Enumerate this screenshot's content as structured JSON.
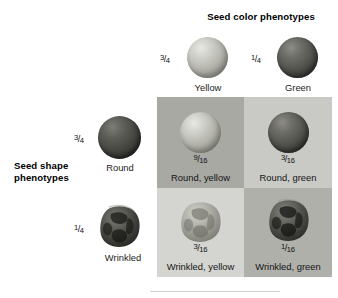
{
  "figure": {
    "type": "dihybrid-cross-phenotype-grid",
    "column_header": "Seed color phenotypes",
    "row_header_line1": "Seed shape",
    "row_header_line2": "phenotypes"
  },
  "column_traits": [
    {
      "label": "Yellow",
      "fraction_num": "3",
      "fraction_slash": "/",
      "fraction_den": "4",
      "seed_style": "round-yellow"
    },
    {
      "label": "Green",
      "fraction_num": "1",
      "fraction_slash": "/",
      "fraction_den": "4",
      "seed_style": "round-green"
    }
  ],
  "row_traits": [
    {
      "label": "Round",
      "fraction_num": "3",
      "fraction_slash": "/",
      "fraction_den": "4",
      "seed_style": "round-green"
    },
    {
      "label": "Wrinkled",
      "fraction_num": "1",
      "fraction_slash": "/",
      "fraction_den": "4",
      "seed_style": "wrinkled-green"
    }
  ],
  "quadrants": [
    {
      "label": "Round, yellow",
      "fraction_num": "9",
      "fraction_slash": "/",
      "fraction_den": "16",
      "background": "#a9a9a4"
    },
    {
      "label": "Round, green",
      "fraction_num": "3",
      "fraction_slash": "/",
      "fraction_den": "16",
      "background": "#c9c9c5"
    },
    {
      "label": "Wrinkled, yellow",
      "fraction_num": "3",
      "fraction_slash": "/",
      "fraction_den": "16",
      "background": "#d4d4d0"
    },
    {
      "label": "Wrinkled, green",
      "fraction_num": "1",
      "fraction_slash": "/",
      "fraction_den": "16",
      "background": "#b0b0ab"
    }
  ]
}
